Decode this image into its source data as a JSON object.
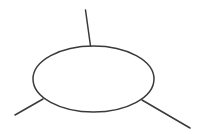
{
  "diagram": {
    "canvas": {
      "width": 200,
      "height": 134,
      "background": "#ffffff"
    },
    "stroke": {
      "color": "#3a3a3a",
      "width": 1.5
    },
    "ellipse": {
      "cx": 93.5,
      "cy": 79,
      "rx": 60.5,
      "ry": 33
    },
    "lines": [
      {
        "id": "top",
        "x1": 85.5,
        "y1": 10,
        "x2": 90.5,
        "y2": 46
      },
      {
        "id": "left",
        "x1": 15,
        "y1": 115,
        "x2": 43,
        "y2": 99
      },
      {
        "id": "right",
        "x1": 142,
        "y1": 100,
        "x2": 190,
        "y2": 128
      }
    ]
  }
}
